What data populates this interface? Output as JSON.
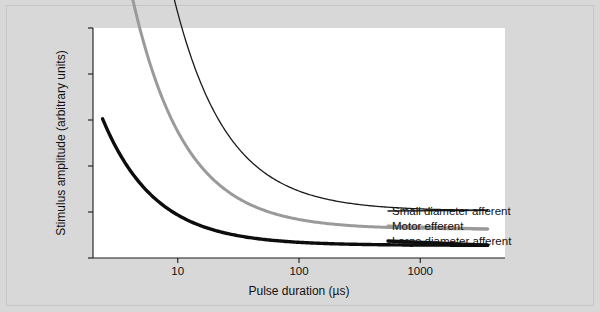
{
  "figure": {
    "background_color": "#d8d8d8",
    "panel_color": "#ffffff",
    "axis_color": "#1a1a1a"
  },
  "chart_data": {
    "type": "line",
    "title": "",
    "subtitle": "",
    "xlabel": "Pulse duration (µs)",
    "ylabel": "Stimulus amplitude (arbitrary units)",
    "x_scale": "log",
    "y_scale": "linear",
    "xlim": [
      2,
      5000
    ],
    "ylim": [
      0,
      1
    ],
    "grid": false,
    "legend_position": "right-inline-labels",
    "x_tick_labels": [
      "10",
      "100",
      "1000"
    ],
    "x_tick_values": [
      10,
      100,
      1000
    ],
    "y_tick_labels": [
      "",
      "",
      "",
      "",
      "",
      ""
    ],
    "y_ticks_unlabeled": true,
    "y_tick_count": 6,
    "annotation": "Strength-duration curves: stimulus amplitude required falls as pulse duration increases; large diameter afferents have the lowest threshold, small diameter afferents the highest.",
    "series": [
      {
        "name": "Small diameter afferent",
        "label": "Small diameter afferent",
        "color": "#1a1a1a",
        "stroke_class": "curve-thin",
        "rheobase": 0.205,
        "chronaxie": 42,
        "x_start": 4.1,
        "x_end": 3600,
        "label_y_px": 211
      },
      {
        "name": "Motor efferent",
        "label": "Motor efferent",
        "color": "#9a9a9a",
        "stroke_class": "curve-mid",
        "rheobase": 0.125,
        "chronaxie": 34,
        "x_start": 3.1,
        "x_end": 3600,
        "label_y_px": 226
      },
      {
        "name": "Large diameter afferent",
        "label": "Large diameter afferent",
        "color": "#0d0d0d",
        "stroke_class": "curve-thick",
        "rheobase": 0.055,
        "chronaxie": 24,
        "x_start": 2.4,
        "x_end": 3600,
        "label_y_px": 241
      }
    ]
  },
  "axes": {
    "x_axis_name": "pulse-duration-axis",
    "y_axis_name": "stimulus-amplitude-axis"
  }
}
